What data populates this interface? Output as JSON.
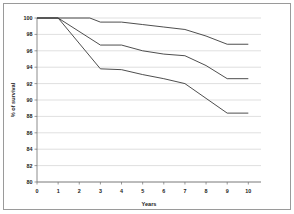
{
  "chart_data": {
    "type": "line",
    "title": "",
    "xlabel": "Years",
    "ylabel": "% of survival",
    "xlim": [
      0,
      10.6
    ],
    "ylim": [
      80,
      100
    ],
    "grid": true,
    "legend": "none",
    "x_ticks": [
      "0",
      "1",
      "2",
      "3",
      "4",
      "5",
      "6",
      "7",
      "8",
      "9",
      "10"
    ],
    "y_ticks": [
      "80",
      "82",
      "84",
      "86",
      "88",
      "90",
      "92",
      "94",
      "96",
      "98",
      "100"
    ],
    "series": [
      {
        "name": "upper-curve",
        "color": "#3a3a3a",
        "x": [
          0,
          1,
          2.5,
          3,
          4,
          5,
          6,
          7,
          8,
          9,
          10
        ],
        "y": [
          100,
          100,
          100,
          99.5,
          99.5,
          99.2,
          98.9,
          98.6,
          97.8,
          96.8,
          96.8
        ]
      },
      {
        "name": "middle-curve",
        "color": "#3a3a3a",
        "x": [
          0,
          1,
          3,
          4,
          5,
          6,
          7,
          8,
          9,
          10
        ],
        "y": [
          100,
          100,
          96.7,
          96.7,
          96.0,
          95.6,
          95.4,
          94.2,
          92.6,
          92.6
        ]
      },
      {
        "name": "lower-curve",
        "color": "#3a3a3a",
        "x": [
          0,
          1,
          3,
          4,
          5,
          6,
          7,
          8,
          9,
          10
        ],
        "y": [
          100,
          100,
          93.8,
          93.7,
          93.1,
          92.6,
          92.0,
          90.2,
          88.4,
          88.4
        ]
      }
    ]
  },
  "axes": {
    "x_title": "Years",
    "y_title": "% of survival"
  }
}
